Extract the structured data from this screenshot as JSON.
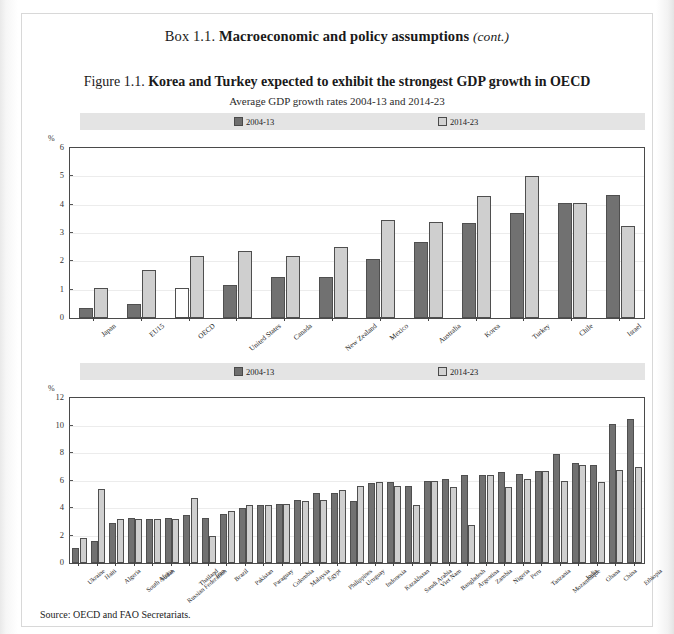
{
  "box": {
    "lead": "Box 1.1.",
    "title": "Macroeconomic and policy assumptions",
    "cont": "(cont.)"
  },
  "figure": {
    "lead": "Figure 1.1.",
    "title": "Korea and Turkey expected to exhibit the strongest GDP growth in OECD",
    "subtitle": "Average GDP growth rates 2004-13 and 2014-23"
  },
  "legend": {
    "series1": "2004-13",
    "series2": "2014-23",
    "color_dark": "#717171",
    "color_light": "#cfcfcf"
  },
  "axis": {
    "unit": "%"
  },
  "source": {
    "label": "Source:",
    "text": "OECD and FAO Secretariats."
  },
  "chart_data": [
    {
      "type": "bar",
      "title": "Korea and Turkey expected to exhibit the strongest GDP growth in OECD",
      "subtitle": "Average GDP growth rates 2004-13 and 2014-23",
      "xlabel": "",
      "ylabel": "%",
      "ylim": [
        0,
        6
      ],
      "yticks": [
        0,
        1,
        2,
        3,
        4,
        5,
        6
      ],
      "grid": true,
      "legend_position": "top",
      "categories": [
        "Japan",
        "EU15",
        "OECD",
        "United States",
        "Canada",
        "New Zealand",
        "Mexico",
        "Australia",
        "Korea",
        "Turkey",
        "Chile",
        "Israel"
      ],
      "series": [
        {
          "name": "2004-13",
          "values": [
            0.35,
            0.5,
            1.05,
            1.15,
            1.45,
            1.45,
            2.1,
            2.7,
            3.35,
            3.7,
            4.05,
            4.35
          ]
        },
        {
          "name": "2014-23",
          "values": [
            1.05,
            1.7,
            2.2,
            2.35,
            2.2,
            2.5,
            3.45,
            3.4,
            4.3,
            5.0,
            4.05,
            3.25
          ]
        }
      ]
    },
    {
      "type": "bar",
      "title": "",
      "xlabel": "",
      "ylabel": "%",
      "ylim": [
        0,
        12
      ],
      "yticks": [
        0,
        2,
        4,
        6,
        8,
        10,
        12
      ],
      "grid": true,
      "legend_position": "top",
      "categories": [
        "Ukraine",
        "Haiti",
        "Algeria",
        "South Africa",
        "Sudan",
        "Russian Federation",
        "Thailand",
        "Iran",
        "Brazil",
        "Pakistan",
        "Paraguay",
        "Colombia",
        "Malaysia",
        "Egypt",
        "Philippines",
        "Uruguay",
        "Indonesia",
        "Kazakhstan",
        "Saudi Arabia",
        "Viet Nam",
        "Bangladesh",
        "Argentina",
        "Zambia",
        "Nigeria",
        "Peru",
        "Tanzania",
        "Mozambique",
        "India",
        "Ghana",
        "China",
        "Ethiopia"
      ],
      "series": [
        {
          "name": "2004-13",
          "values": [
            1.1,
            1.6,
            2.9,
            3.3,
            3.2,
            3.3,
            3.5,
            3.3,
            3.6,
            4.0,
            4.2,
            4.3,
            4.6,
            5.1,
            5.1,
            4.5,
            5.8,
            5.9,
            5.6,
            6.0,
            6.1,
            6.4,
            6.4,
            6.6,
            6.5,
            6.7,
            7.9,
            7.3,
            7.1,
            10.1,
            10.5
          ]
        },
        {
          "name": "2014-23",
          "values": [
            1.8,
            5.4,
            3.2,
            3.2,
            3.2,
            3.2,
            4.7,
            2.0,
            3.8,
            4.2,
            4.2,
            4.3,
            4.5,
            4.6,
            5.3,
            5.6,
            5.9,
            5.6,
            4.2,
            6.0,
            5.5,
            2.8,
            6.4,
            5.5,
            6.1,
            6.7,
            6.0,
            7.1,
            5.9,
            6.8,
            7.0
          ]
        }
      ]
    }
  ]
}
